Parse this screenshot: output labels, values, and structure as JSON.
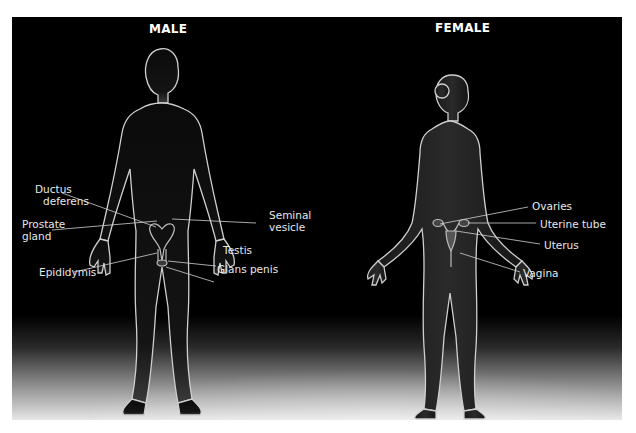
{
  "headings": {
    "male": "MALE",
    "female": "FEMALE"
  },
  "male_labels": {
    "ductus_deferens_1": "Ductus",
    "ductus_deferens_2": "deferens",
    "prostate_gland_1": "Prostate",
    "prostate_gland_2": "gland",
    "epididymis": "Epididymis",
    "seminal_vesicle_1": "Seminal",
    "seminal_vesicle_2": "vesicle",
    "testis": "Testis",
    "glans_penis": "Glans penis"
  },
  "female_labels": {
    "ovaries": "Ovaries",
    "uterine_tube": "Uterine tube",
    "uterus": "Uterus",
    "vagina": "Vagina"
  },
  "colors": {
    "background": "#000000",
    "label_text": "#e8e8e8",
    "leader_line": "#d0d0d0",
    "rim_light": "#cfcfcf"
  }
}
